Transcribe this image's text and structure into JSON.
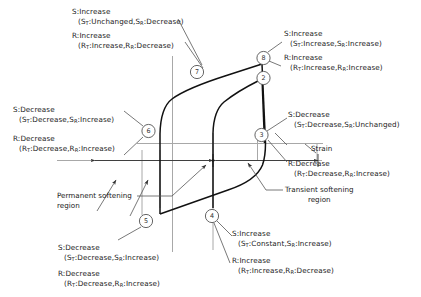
{
  "figure": {
    "type": "stress-strain-hysteresis-schematic",
    "axis_label_strain": "Strain",
    "region_labels": {
      "permanent": "Permanent softening",
      "permanent2": "region",
      "transient": "Transient softening",
      "transient2": "region"
    },
    "markers": [
      "2",
      "3",
      "4",
      "5",
      "6",
      "7",
      "8"
    ]
  },
  "annotations": {
    "a7": {
      "s_line1": "S:Increase",
      "s_line2": "(S",
      "s_sub1": "T",
      "s_line2b": ":Unchanged,S",
      "s_sub2": "R",
      "s_line2c": ":Decrease)",
      "r_line1": "R:Increase",
      "r_line2": "(R",
      "r_sub1": "T",
      "r_line2b": ":Increase,R",
      "r_sub2": "R",
      "r_line2c": ":Decrease)"
    },
    "a8": {
      "s_line1": "S:Increase",
      "s_line2": "(S",
      "s_sub1": "T",
      "s_line2b": ":Increase,S",
      "s_sub2": "R",
      "s_line2c": ":Increase)",
      "r_line1": "R:Increase",
      "r_line2": "(R",
      "r_sub1": "T",
      "r_line2b": ":Increase,R",
      "r_sub2": "R",
      "r_line2c": ":Increase)"
    },
    "a6": {
      "s_line1": "S:Decrease",
      "s_line2": "(S",
      "s_sub1": "T",
      "s_line2b": ":Decrease,S",
      "s_sub2": "R",
      "s_line2c": ":Increase)",
      "r_line1": "R:Decrease",
      "r_line2": "(R",
      "r_sub1": "T",
      "r_line2b": ":Decrease,R",
      "r_sub2": "R",
      "r_line2c": ":Increase)"
    },
    "a3": {
      "s_line1": "S:Decrease",
      "s_line2": "(S",
      "s_sub1": "T",
      "s_line2b": ":Decrease,S",
      "s_sub2": "R",
      "s_line2c": ":Unchanged)",
      "r_line1": "R:Decrease",
      "r_line2": "(R",
      "r_sub1": "T",
      "r_line2b": ":Decrease,R",
      "r_sub2": "R",
      "r_line2c": ":Increase)"
    },
    "a5": {
      "s_line1": "S:Decrease",
      "s_line2": "(S",
      "s_sub1": "T",
      "s_line2b": ":Decrease,S",
      "s_sub2": "R",
      "s_line2c": ":Increase)",
      "r_line1": "R:Decrease",
      "r_line2": "(R",
      "r_sub1": "T",
      "r_line2b": ":Decrease,R",
      "r_sub2": "R",
      "r_line2c": ":Increase)"
    },
    "a4": {
      "s_line1": "S:Increase",
      "s_line2": "(S",
      "s_sub1": "T",
      "s_line2b": ":Constant,S",
      "s_sub2": "R",
      "s_line2c": ":Increase)",
      "r_line1": "R:Increase",
      "r_line2": "(R",
      "r_sub1": "T",
      "r_line2b": ":Increase,R",
      "r_sub2": "R",
      "r_line2c": ":Decrease)"
    }
  },
  "colors": {
    "curve": "#111111",
    "guide": "#9a9a9a",
    "leader": "#5a5a5a",
    "text": "#1a1a1a"
  }
}
